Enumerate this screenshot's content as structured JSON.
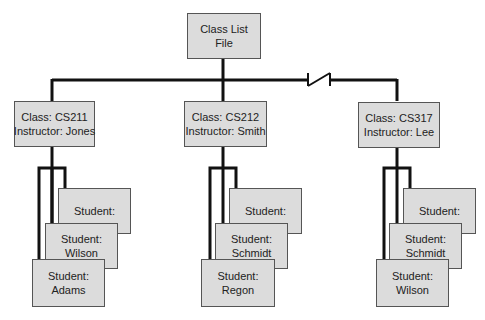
{
  "root": {
    "line1": "Class List",
    "line2": "File"
  },
  "classes": [
    {
      "class_label": "Class: CS211",
      "instructor_label": "Instructor: Jones",
      "students": [
        {
          "line1": "Student:",
          "line2": ""
        },
        {
          "line1": "Student:",
          "line2": "Wilson"
        },
        {
          "line1": "Student:",
          "line2": "Adams"
        }
      ]
    },
    {
      "class_label": "Class: CS212",
      "instructor_label": "Instructor: Smith",
      "students": [
        {
          "line1": "Student:",
          "line2": ""
        },
        {
          "line1": "Student:",
          "line2": "Schmidt"
        },
        {
          "line1": "Student:",
          "line2": "Regon"
        }
      ]
    },
    {
      "class_label": "Class: CS317",
      "instructor_label": "Instructor: Lee",
      "students": [
        {
          "line1": "Student:",
          "line2": ""
        },
        {
          "line1": "Student:",
          "line2": "Schmidt"
        },
        {
          "line1": "Student:",
          "line2": "Wilson"
        }
      ]
    }
  ],
  "colors": {
    "box_fill": "#dcdcdc",
    "line": "#111111",
    "border": "#555555"
  }
}
